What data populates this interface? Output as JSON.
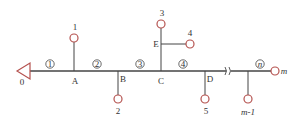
{
  "diagram": {
    "type": "pipe network / tree",
    "colors": {
      "line": "#444444",
      "node": "#b5524f",
      "text": "#333333"
    },
    "source": {
      "label": "0"
    },
    "junctions": [
      {
        "id": "A",
        "label": "A"
      },
      {
        "id": "B",
        "label": "B"
      },
      {
        "id": "C",
        "label": "C"
      },
      {
        "id": "D",
        "label": "D"
      },
      {
        "id": "E",
        "label": "E"
      }
    ],
    "outlets": [
      {
        "label": "1"
      },
      {
        "label": "2"
      },
      {
        "label": "3"
      },
      {
        "label": "4"
      },
      {
        "label": "5"
      },
      {
        "label": "m-1"
      },
      {
        "label": "m"
      }
    ],
    "segments": [
      {
        "label": "1"
      },
      {
        "label": "2"
      },
      {
        "label": "3"
      },
      {
        "label": "4"
      },
      {
        "label": "n"
      }
    ]
  }
}
